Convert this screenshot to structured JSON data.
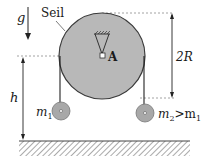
{
  "diagram": {
    "labels": {
      "gravity": "g",
      "rope": "Seil",
      "pivot": "A",
      "diameter": "2R",
      "height": "h",
      "mass1": "m",
      "mass1_sub": "1",
      "mass2": "m",
      "mass2_sub": "2",
      "mass2_relation": ">m",
      "mass2_relation_sub": "1"
    },
    "colors": {
      "disk_fill": "#b8b8b8",
      "disk_stroke": "#3a3a3a",
      "mass_fill": "#a8a8a8",
      "line": "#222222",
      "dashed": "#8a8a8a",
      "hatch": "#555555"
    },
    "elements": [
      "pulley-disk",
      "fixed-support-A",
      "rope-left",
      "rope-right",
      "mass-m1",
      "mass-m2",
      "ground",
      "gravity-arrow",
      "height-dimension-h",
      "diameter-dimension-2R"
    ]
  }
}
